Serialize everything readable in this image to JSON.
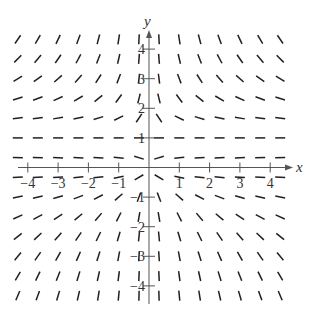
{
  "figure": {
    "x_axis_label": "x",
    "y_axis_label": "y"
  },
  "chart_data": {
    "type": "slope_field",
    "xlabel": "x",
    "ylabel": "y",
    "xlim": [
      -4.3,
      4.7
    ],
    "ylim": [
      -4.3,
      4.7
    ],
    "x_ticks": [
      -4,
      -3,
      -2,
      -1,
      1,
      2,
      3,
      4
    ],
    "x_tick_labels": [
      "−4",
      "−3",
      "−2",
      "−1",
      "1",
      "2",
      "3",
      "4"
    ],
    "y_ticks": [
      -4,
      -3,
      -2,
      -1,
      1,
      2,
      3,
      4
    ],
    "y_tick_labels": [
      "−4",
      "−3",
      "−2",
      "−1",
      "1",
      "2",
      "3",
      "4"
    ],
    "grid": false,
    "sample_x": [
      -4.33,
      -3.67,
      -3.0,
      -2.33,
      -1.67,
      -1.0,
      -0.33,
      0.33,
      1.0,
      1.67,
      2.33,
      3.0,
      3.67,
      4.33
    ],
    "sample_y": [
      4.33,
      3.67,
      3.0,
      2.33,
      1.67,
      1.0,
      0.33,
      -0.33,
      -1.0,
      -1.67,
      -2.33,
      -3.0,
      -3.67,
      -4.33
    ],
    "slope_rule": "dy/dx = y(1 - y) / x (qualitative: horizontal along y = 0 and y = 1; mirror-symmetric about the y-axis)",
    "equilibria_y": [
      0,
      1
    ],
    "segment_length_px": 10,
    "color": "#231f20"
  },
  "layout": {
    "origin_px": [
      149,
      167.5
    ],
    "unit_x_px": 30.3,
    "unit_y_px": 29.6,
    "x_axis_end_px": 293,
    "y_axis_top_px": 30
  }
}
